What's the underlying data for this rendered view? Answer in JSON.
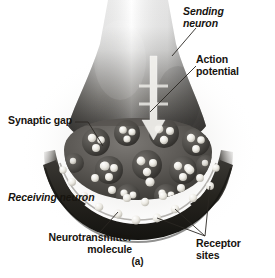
{
  "figure": {
    "caption": "(a)",
    "background_color": "#ffffff",
    "text_color": "#17140f"
  },
  "labels": {
    "sending_neuron": "Sending\nneuron",
    "action_potential": "Action\npotential",
    "synaptic_gap": "Synaptic gap",
    "receiving_neuron": "Receiving neuron",
    "neurotransmitter_molecule": "Neurotransmitter\nmolecule",
    "receptor_sites": "Receptor\nsites"
  },
  "artwork": {
    "style": "grayscale-photoreal-illustration",
    "axon_terminal_gradient": [
      "#fdfdfd",
      "#b9b9b9",
      "#6a6a6a",
      "#3a3936"
    ],
    "membrane_color": "#2a2825",
    "vesicle_color": "#4a4744",
    "molecule_color": "#f4f2ec",
    "arrow_color": "#f2f1ec"
  }
}
